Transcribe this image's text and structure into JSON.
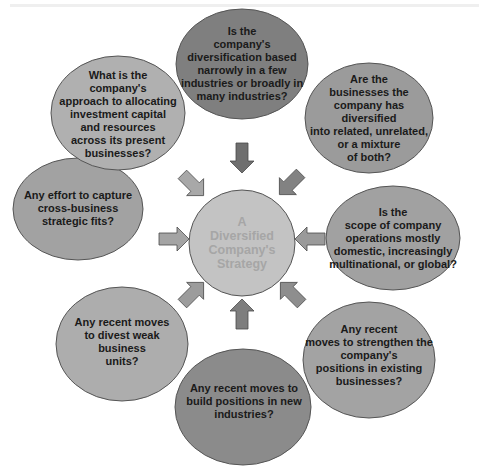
{
  "diagram": {
    "center": {
      "label": "A\nDiversified\nCompany's\nStrategy",
      "fill": "#c3c3c3",
      "text_color": "#a6a6a6"
    },
    "bubbles": [
      {
        "id": "top",
        "text": "Is the\ncompany's\ndiversification  based\nnarrowly in a few\nindustries or broadly in\nmany industries?",
        "fill": "#7f7f7f"
      },
      {
        "id": "top-right",
        "text": "Are the\nbusinesses the\ncompany has diversified\ninto related, unrelated,\nor a mixture\nof both?",
        "fill": "#9b9b9b"
      },
      {
        "id": "right",
        "text": "Is the\nscope of company\noperations mostly\ndomestic, increasingly\nmultinational, or global?",
        "fill": "#a1a1a1"
      },
      {
        "id": "bottom-right",
        "text": "Any recent\nmoves to strengthen the\ncompany's\npositions in existing\nbusinesses?",
        "fill": "#a3a3a3"
      },
      {
        "id": "bottom",
        "text": "Any recent moves to\nbuild positions in new\nindustries?",
        "fill": "#8b8b8b"
      },
      {
        "id": "bottom-left",
        "text": "Any recent moves\nto divest weak\nbusiness\nunits?",
        "fill": "#adadad"
      },
      {
        "id": "left",
        "text": "Any effort to capture\ncross-business\nstrategic fits?",
        "fill": "#a2a2a2"
      },
      {
        "id": "top-left",
        "text": "What is the\ncompany's\napproach to allocating\ninvestment capital\nand resources\nacross its present\nbusinesses?",
        "fill": "#b0b0b0"
      }
    ],
    "arrows": [
      {
        "direction": "down",
        "fill": "#6f6f6f"
      },
      {
        "direction": "down-left",
        "fill": "#828282"
      },
      {
        "direction": "left",
        "fill": "#9a9a9a"
      },
      {
        "direction": "up-left",
        "fill": "#8e8e8e"
      },
      {
        "direction": "up",
        "fill": "#7e7e7e"
      },
      {
        "direction": "up-right",
        "fill": "#9c9c9c"
      },
      {
        "direction": "right",
        "fill": "#a4a4a4"
      },
      {
        "direction": "down-right",
        "fill": "#a8a8a8"
      }
    ]
  }
}
